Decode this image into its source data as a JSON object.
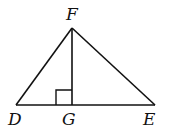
{
  "diagram": {
    "type": "geometry",
    "colors": {
      "stroke": "#111111",
      "background": "#ffffff"
    },
    "points": {
      "F": {
        "label": "F",
        "x": 72,
        "y": 28
      },
      "D": {
        "label": "D",
        "x": 16,
        "y": 105
      },
      "G": {
        "label": "G",
        "x": 72,
        "y": 105
      },
      "E": {
        "label": "E",
        "x": 155,
        "y": 105
      }
    },
    "segments": [
      "DF",
      "FE",
      "DE",
      "FG"
    ],
    "right_angle_at": "G"
  }
}
